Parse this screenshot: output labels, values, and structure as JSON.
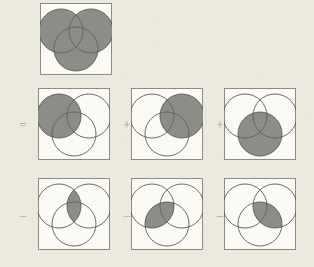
{
  "figure": {
    "background_color": "#eceade",
    "box_fill_color": "#fbfaf4",
    "box_border_color": "#8c8c84",
    "circle_stroke_color": "#5a5a55",
    "shade_color": "#8d8d87",
    "operator_color": "#9b9a90",
    "set_labels": [
      "A",
      "B",
      "C"
    ]
  },
  "operators": {
    "equals": "=",
    "plus": "+",
    "minus": "–"
  },
  "rows": [
    {
      "name": "result-row",
      "operator": "",
      "cells": [
        {
          "name": "union-abc",
          "expression": "A ∪ B ∪ C",
          "shaded_regions": [
            "A",
            "B",
            "C",
            "AB",
            "AC",
            "BC",
            "ABC"
          ],
          "operator_before": ""
        }
      ]
    },
    {
      "name": "addition-row",
      "operator": "=",
      "cells": [
        {
          "name": "set-a",
          "expression": "A",
          "shaded_regions": [
            "A",
            "AB",
            "AC",
            "ABC"
          ],
          "operator_before": "="
        },
        {
          "name": "set-b",
          "expression": "B",
          "shaded_regions": [
            "B",
            "AB",
            "BC",
            "ABC"
          ],
          "operator_before": "+"
        },
        {
          "name": "set-c",
          "expression": "C",
          "shaded_regions": [
            "C",
            "AC",
            "BC",
            "ABC"
          ],
          "operator_before": "+"
        }
      ]
    },
    {
      "name": "subtraction-row",
      "operator": "–",
      "cells": [
        {
          "name": "intersection-ab",
          "expression": "A ∩ B",
          "shaded_regions": [
            "AB",
            "ABC"
          ],
          "operator_before": "–"
        },
        {
          "name": "intersection-ac",
          "expression": "A ∩ C",
          "shaded_regions": [
            "AC",
            "ABC"
          ],
          "operator_before": "–"
        },
        {
          "name": "intersection-bc",
          "expression": "B ∩ C",
          "shaded_regions": [
            "BC",
            "ABC"
          ],
          "operator_before": "–"
        }
      ]
    }
  ]
}
